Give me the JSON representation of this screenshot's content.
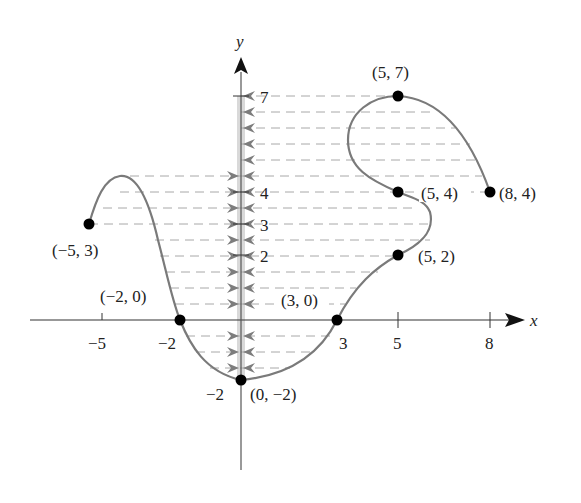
{
  "chart_data": {
    "type": "line",
    "title": "",
    "xlabel": "x",
    "ylabel": "y",
    "x_ticks": [
      -5,
      -2,
      3,
      5,
      8
    ],
    "y_ticks": [
      7,
      4,
      3,
      2,
      -2
    ],
    "grid": false,
    "labeled_points": [
      {
        "x": -5,
        "y": 3,
        "label": "(−5, 3)"
      },
      {
        "x": -2,
        "y": 0,
        "label": "(−2, 0)"
      },
      {
        "x": 0,
        "y": -2,
        "label": "(0, −2)"
      },
      {
        "x": 3,
        "y": 0,
        "label": "(3, 0)"
      },
      {
        "x": 5,
        "y": 2,
        "label": "(5, 2)"
      },
      {
        "x": 5,
        "y": 4,
        "label": "(5, 4)"
      },
      {
        "x": 5,
        "y": 7,
        "label": "(5, 7)"
      },
      {
        "x": 8,
        "y": 4,
        "label": "(8, 4)"
      }
    ],
    "curve_points": [
      [
        -5,
        3
      ],
      [
        -4.6,
        4.2
      ],
      [
        -3.8,
        4.5
      ],
      [
        -3.2,
        3.8
      ],
      [
        -2.6,
        1.8
      ],
      [
        -2,
        0
      ],
      [
        -1.4,
        -1.4
      ],
      [
        -0.6,
        -1.9
      ],
      [
        0,
        -2
      ],
      [
        1.5,
        -1.6
      ],
      [
        3,
        0
      ],
      [
        4,
        1.4
      ],
      [
        5,
        2
      ],
      [
        6,
        3
      ],
      [
        5.8,
        3.6
      ],
      [
        5,
        4
      ],
      [
        3.8,
        5.0
      ],
      [
        3.7,
        6.3
      ],
      [
        5,
        7
      ],
      [
        6.8,
        6.4
      ],
      [
        8,
        4
      ]
    ],
    "projection_levels": [
      7,
      6.5,
      6,
      5.5,
      5,
      4.5,
      4,
      3.5,
      3,
      2.5,
      2,
      1.5,
      1,
      0.5,
      -0.5,
      -1,
      -1.5
    ],
    "xlim": [
      -6.8,
      9.3
    ],
    "ylim": [
      -4.8,
      9
    ]
  },
  "labels": {
    "x_axis": "x",
    "y_axis": "y",
    "tick_x_m5": "−5",
    "tick_x_m2": "−2",
    "tick_x_3": "3",
    "tick_x_5": "5",
    "tick_x_8": "8",
    "tick_y_7": "7",
    "tick_y_4": "4",
    "tick_y_3": "3",
    "tick_y_2": "2",
    "tick_y_m2": "−2",
    "pt_m5_3": "(−5, 3)",
    "pt_m2_0": "(−2, 0)",
    "pt_0_m2": "(0, −2)",
    "pt_3_0": "(3, 0)",
    "pt_5_2": "(5, 2)",
    "pt_5_4": "(5, 4)",
    "pt_5_7": "(5, 7)",
    "pt_8_4": "(8, 4)"
  },
  "colors": {
    "curve": "#7a7a7a",
    "dash": "#a8a8a8",
    "arrow": "#7d7d7d",
    "axis": "#333333",
    "point": "#000000",
    "yaxis_shade": "#d6d6d6"
  }
}
